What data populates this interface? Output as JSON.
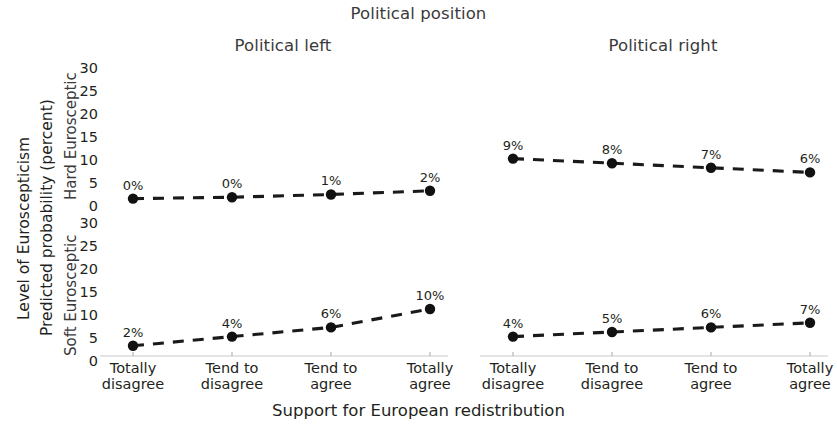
{
  "figure": {
    "super_title": "Political position",
    "x_axis_title": "Support for European redistribution",
    "y_axis_title_line1": "Level of Euroscepticism",
    "y_axis_title_line2": "Predicted probability (percent)",
    "column_titles": [
      "Political left",
      "Political right"
    ],
    "row_titles": [
      "Hard Eurosceptic",
      "Soft Eurosceptic"
    ]
  },
  "axis": {
    "y_ticks": [
      "30",
      "25",
      "20",
      "15",
      "10",
      "5",
      "0"
    ],
    "x_categories": [
      {
        "line1": "Totally",
        "line2": "disagree"
      },
      {
        "line1": "Tend to",
        "line2": "disagree"
      },
      {
        "line1": "Tend to",
        "line2": "agree"
      },
      {
        "line1": "Totally",
        "line2": "agree"
      }
    ]
  },
  "colors": {
    "line": "#1a1a1a",
    "marker": "#111111",
    "axis": "#c9c9c9",
    "text": "#231f20",
    "title_text": "#3a3a3a"
  },
  "labels": {
    "hard_left": [
      "0%",
      "0%",
      "1%",
      "2%"
    ],
    "hard_right": [
      "9%",
      "8%",
      "7%",
      "6%"
    ],
    "soft_left": [
      "2%",
      "4%",
      "6%",
      "10%"
    ],
    "soft_right": [
      "4%",
      "5%",
      "6%",
      "7%"
    ]
  },
  "chart_data": {
    "type": "line",
    "title": "Political position",
    "xlabel": "Support for European redistribution",
    "ylabel": "Level of Euroscepticism — Predicted probability (percent)",
    "categories": [
      "Totally disagree",
      "Tend to disagree",
      "Tend to agree",
      "Totally agree"
    ],
    "ylim": [
      0,
      30
    ],
    "yticks": [
      0,
      5,
      10,
      15,
      20,
      25,
      30
    ],
    "grid": false,
    "legend": "none",
    "facet_rows": [
      "Hard Eurosceptic",
      "Soft Eurosceptic"
    ],
    "facet_cols": [
      "Political left",
      "Political right"
    ],
    "panels": [
      {
        "row": "Hard Eurosceptic",
        "col": "Political left",
        "values": [
          0.3,
          0.6,
          1.2,
          2.0
        ],
        "data_labels": [
          "0%",
          "0%",
          "1%",
          "2%"
        ]
      },
      {
        "row": "Hard Eurosceptic",
        "col": "Political right",
        "values": [
          9,
          8,
          7,
          6
        ],
        "data_labels": [
          "9%",
          "8%",
          "7%",
          "6%"
        ]
      },
      {
        "row": "Soft Eurosceptic",
        "col": "Political left",
        "values": [
          2,
          4,
          6,
          10
        ],
        "data_labels": [
          "2%",
          "4%",
          "6%",
          "10%"
        ]
      },
      {
        "row": "Soft Eurosceptic",
        "col": "Political right",
        "values": [
          4,
          5,
          6,
          7
        ],
        "data_labels": [
          "4%",
          "5%",
          "6%",
          "7%"
        ]
      }
    ]
  }
}
